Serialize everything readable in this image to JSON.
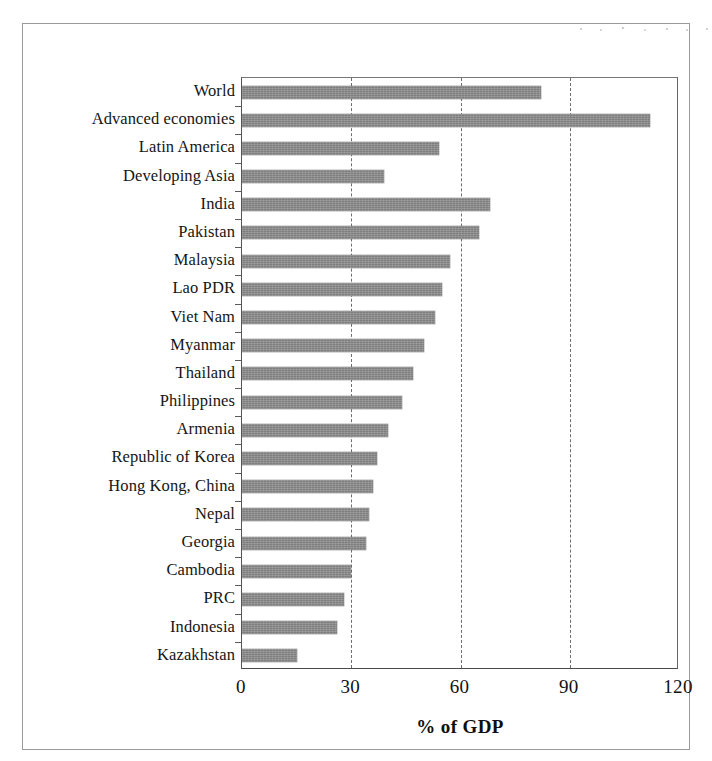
{
  "figure": {
    "frame_present": true,
    "bar_color": "#7e7e7e",
    "grid_color": "#6e6e6e",
    "axis_color": "#4a4a4a"
  },
  "chart_data": {
    "type": "bar",
    "orientation": "horizontal",
    "title": "",
    "subtitle": "",
    "xlabel": "% of GDP",
    "ylabel": "",
    "xlim": [
      0,
      120
    ],
    "xticks": [
      0,
      30,
      60,
      90,
      120
    ],
    "xtick_labels": [
      "0",
      "30",
      "60",
      "90",
      "120"
    ],
    "grid": "vertical dashed gridlines at 30, 60, 90",
    "legend": "none",
    "annotations": [],
    "categories": [
      "World",
      "Advanced economies",
      "Latin America",
      "Developing Asia",
      "India",
      "Pakistan",
      "Malaysia",
      "Lao PDR",
      "Viet Nam",
      "Myanmar",
      "Thailand",
      "Philippines",
      "Armenia",
      "Republic of Korea",
      "Hong Kong, China",
      "Nepal",
      "Georgia",
      "Cambodia",
      "PRC",
      "Indonesia",
      "Kazakhstan"
    ],
    "values": [
      82,
      112,
      54,
      39,
      68,
      65,
      57,
      55,
      53,
      50,
      47,
      44,
      40,
      37,
      36,
      35,
      34,
      30,
      28,
      26,
      15
    ],
    "series": [
      {
        "name": "% of GDP",
        "values": [
          82,
          112,
          54,
          39,
          68,
          65,
          57,
          55,
          53,
          50,
          47,
          44,
          40,
          37,
          36,
          35,
          34,
          30,
          28,
          26,
          15
        ]
      }
    ]
  }
}
